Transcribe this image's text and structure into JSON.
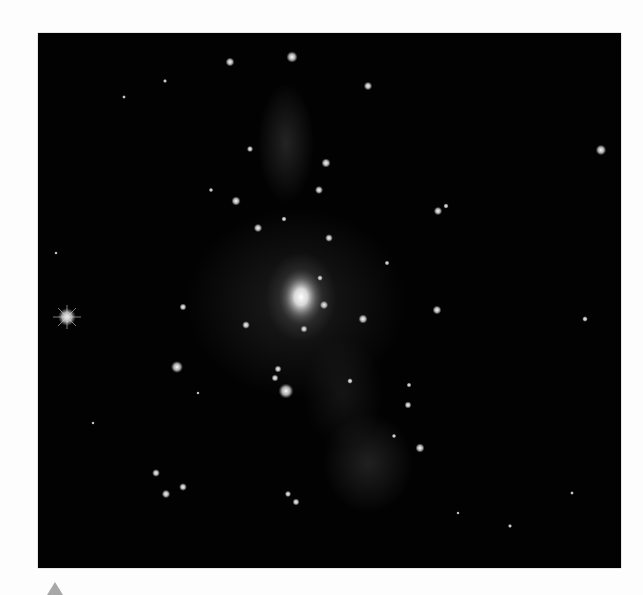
{
  "figure": {
    "background_color": "#020202",
    "glow_color": "#8a8a8a",
    "central_galaxy": {
      "cx": 263,
      "cy": 264,
      "rx": 22,
      "ry": 28
    },
    "bright_star": {
      "cx": 29,
      "cy": 284
    },
    "diffuse_glow": [
      {
        "cx": 248,
        "cy": 110,
        "rx": 28,
        "ry": 60,
        "opacity": 0.22
      },
      {
        "cx": 258,
        "cy": 270,
        "rx": 110,
        "ry": 95,
        "opacity": 0.18
      },
      {
        "cx": 330,
        "cy": 430,
        "rx": 45,
        "ry": 50,
        "opacity": 0.2
      },
      {
        "cx": 305,
        "cy": 360,
        "rx": 40,
        "ry": 55,
        "opacity": 0.12
      }
    ],
    "sources": [
      {
        "cx": 254,
        "cy": 24,
        "r": 3.2
      },
      {
        "cx": 192,
        "cy": 29,
        "r": 2.5
      },
      {
        "cx": 127,
        "cy": 48,
        "r": 1.2
      },
      {
        "cx": 330,
        "cy": 53,
        "r": 2.4
      },
      {
        "cx": 86,
        "cy": 64,
        "r": 1.1
      },
      {
        "cx": 563,
        "cy": 117,
        "r": 3.0
      },
      {
        "cx": 212,
        "cy": 116,
        "r": 1.8
      },
      {
        "cx": 288,
        "cy": 130,
        "r": 2.6
      },
      {
        "cx": 281,
        "cy": 157,
        "r": 2.3
      },
      {
        "cx": 198,
        "cy": 168,
        "r": 2.6
      },
      {
        "cx": 220,
        "cy": 195,
        "r": 2.4
      },
      {
        "cx": 246,
        "cy": 186,
        "r": 1.5
      },
      {
        "cx": 291,
        "cy": 205,
        "r": 2.2
      },
      {
        "cx": 400,
        "cy": 178,
        "r": 2.4
      },
      {
        "cx": 408,
        "cy": 173,
        "r": 1.5
      },
      {
        "cx": 173,
        "cy": 157,
        "r": 1.3
      },
      {
        "cx": 349,
        "cy": 230,
        "r": 1.4
      },
      {
        "cx": 282,
        "cy": 245,
        "r": 1.6
      },
      {
        "cx": 286,
        "cy": 272,
        "r": 2.4
      },
      {
        "cx": 266,
        "cy": 296,
        "r": 2.0
      },
      {
        "cx": 208,
        "cy": 292,
        "r": 2.2
      },
      {
        "cx": 325,
        "cy": 286,
        "r": 2.6
      },
      {
        "cx": 399,
        "cy": 277,
        "r": 2.5
      },
      {
        "cx": 145,
        "cy": 274,
        "r": 2.0
      },
      {
        "cx": 139,
        "cy": 334,
        "r": 3.4
      },
      {
        "cx": 240,
        "cy": 336,
        "r": 2.0
      },
      {
        "cx": 237,
        "cy": 345,
        "r": 2.0
      },
      {
        "cx": 248,
        "cy": 358,
        "r": 4.2
      },
      {
        "cx": 312,
        "cy": 348,
        "r": 1.6
      },
      {
        "cx": 371,
        "cy": 352,
        "r": 1.4
      },
      {
        "cx": 370,
        "cy": 372,
        "r": 2.0
      },
      {
        "cx": 382,
        "cy": 415,
        "r": 2.6
      },
      {
        "cx": 356,
        "cy": 403,
        "r": 1.3
      },
      {
        "cx": 118,
        "cy": 440,
        "r": 2.2
      },
      {
        "cx": 145,
        "cy": 454,
        "r": 2.2
      },
      {
        "cx": 128,
        "cy": 461,
        "r": 2.4
      },
      {
        "cx": 250,
        "cy": 461,
        "r": 1.8
      },
      {
        "cx": 258,
        "cy": 469,
        "r": 2.0
      },
      {
        "cx": 472,
        "cy": 493,
        "r": 1.2
      },
      {
        "cx": 547,
        "cy": 286,
        "r": 1.6
      },
      {
        "cx": 18,
        "cy": 220,
        "r": 1.0
      },
      {
        "cx": 55,
        "cy": 390,
        "r": 1.0
      },
      {
        "cx": 534,
        "cy": 460,
        "r": 1.1
      },
      {
        "cx": 420,
        "cy": 480,
        "r": 1.0
      },
      {
        "cx": 160,
        "cy": 360,
        "r": 1.0
      }
    ]
  },
  "page_marker": {
    "shape": "triangle-up",
    "color": "#a8a8a8"
  }
}
